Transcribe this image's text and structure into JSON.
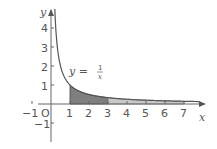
{
  "chart_data": {
    "type": "area",
    "title": "",
    "xlabel": "x",
    "ylabel": "y",
    "xlim": [
      -1,
      8
    ],
    "ylim": [
      -1.5,
      5
    ],
    "x_ticks": [
      "-1",
      "0",
      "1",
      "2",
      "3",
      "4",
      "5",
      "6",
      "7"
    ],
    "y_ticks": [
      "-1",
      "1",
      "2",
      "3",
      "4"
    ],
    "grid": false,
    "curve": {
      "name": "y = 1/x",
      "function": "1/x",
      "domain": [
        0.2,
        7.8
      ]
    },
    "annotations": [
      {
        "text": "y = 1/x",
        "x": 1.6,
        "y": 1.7
      }
    ],
    "shaded_regions": [
      {
        "from": 1,
        "to": 3,
        "color": "#7f7f7f",
        "label": "dark"
      },
      {
        "from": 3,
        "to": 7,
        "color": "#c8c8c8",
        "label": "light"
      }
    ]
  },
  "labels": {
    "x_axis": "x",
    "y_axis": "y",
    "origin": "O",
    "curve_label_lhs": "y =",
    "curve_label_num": "1",
    "curve_label_den": "x",
    "xtick_neg1": "−1",
    "xtick_0": "0",
    "xt1": "1",
    "xt2": "2",
    "xt3": "3",
    "xt4": "4",
    "xt5": "5",
    "xt6": "6",
    "xt7": "7",
    "yt1": "1",
    "yt2": "2",
    "yt3": "3",
    "yt4": "4",
    "ytneg1": "−1"
  },
  "colors": {
    "axis": "#666666",
    "curve": "#555555",
    "dark_fill": "#7f7f7f",
    "light_fill": "#c8c8c8"
  }
}
